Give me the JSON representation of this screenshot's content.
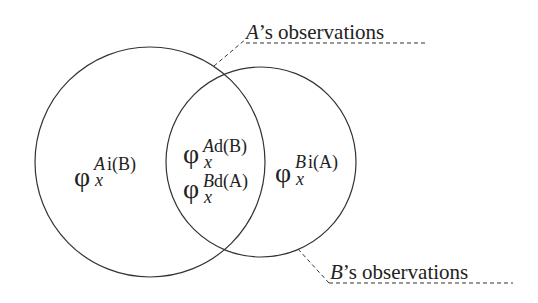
{
  "diagram": {
    "type": "venn",
    "stroke_color": "#333333",
    "circles": [
      {
        "id": "A",
        "cx": 150,
        "cy": 162,
        "r": 115
      },
      {
        "id": "B",
        "cx": 261,
        "cy": 162,
        "r": 95
      }
    ],
    "regions": {
      "a_only": {
        "symbol": "φ",
        "sub": "x",
        "sup_main": "A",
        "sup_rest": "i(B)"
      },
      "intersection_top": {
        "symbol": "φ",
        "sub": "x",
        "sup_main": "A",
        "sup_rest": "d(B)"
      },
      "intersection_bottom": {
        "symbol": "φ",
        "sub": "x",
        "sup_main": "B",
        "sup_rest": "d(A)"
      },
      "b_only": {
        "symbol": "φ",
        "sub": "x",
        "sup_main": "B",
        "sup_rest": "i(A)"
      }
    },
    "callouts": {
      "a": {
        "subject": "A",
        "rest": "’s observations"
      },
      "b": {
        "subject": "B",
        "rest": "’s observations"
      }
    }
  }
}
